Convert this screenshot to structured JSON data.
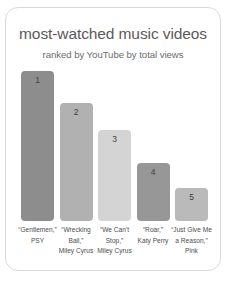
{
  "card": {
    "title": "most-watched music videos",
    "subtitle": "ranked by YouTube by total views"
  },
  "chart_data": {
    "type": "bar",
    "title": "most-watched music videos",
    "subtitle": "ranked by YouTube by total views",
    "xlabel": "",
    "ylabel": "",
    "grid": false,
    "legend": false,
    "categories": [
      "“Gentlemen,” PSY",
      "“Wrecking Ball,” Miley Cyrus",
      "“We Can't Stop,” Miley Cyrus",
      "“Roar,” Katy Perry",
      "“Just Give Me a Reason,” Pink"
    ],
    "values": [
      100,
      79,
      61,
      39,
      22
    ],
    "ylim": [
      0,
      105
    ],
    "ranks": [
      "1",
      "2",
      "3",
      "4",
      "5"
    ],
    "bar_colors": [
      "#8d8d8d",
      "#b1b1b1",
      "#d4d4d4",
      "#979797",
      "#bababa"
    ],
    "bars": [
      {
        "rank": "1",
        "value": 100,
        "color": "#8d8d8d",
        "label_lines": [
          "“Gentlemen,”",
          "PSY"
        ]
      },
      {
        "rank": "2",
        "value": 79,
        "color": "#b1b1b1",
        "label_lines": [
          "“Wrecking",
          "Ball,”",
          "Miley Cyrus"
        ]
      },
      {
        "rank": "3",
        "value": 61,
        "color": "#d4d4d4",
        "label_lines": [
          "“We Can't",
          "Stop,”",
          "Miley Cyrus"
        ]
      },
      {
        "rank": "4",
        "value": 39,
        "color": "#979797",
        "label_lines": [
          "“Roar,”",
          "Katy Perry"
        ]
      },
      {
        "rank": "5",
        "value": 22,
        "color": "#bababa",
        "label_lines": [
          "“Just Give Me",
          "a Reason,”",
          "Pink"
        ]
      }
    ]
  }
}
